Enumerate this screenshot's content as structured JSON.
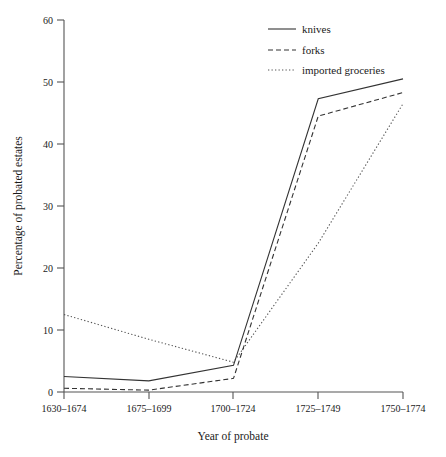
{
  "chart_data": {
    "type": "line",
    "title": "",
    "xlabel": "Year of probate",
    "ylabel": "Percentage of probated estates",
    "categories": [
      "1630–1674",
      "1675–1699",
      "1700–1724",
      "1725–1749",
      "1750–1774"
    ],
    "ylim": [
      0,
      60
    ],
    "yticks": [
      0,
      10,
      20,
      30,
      40,
      50,
      60
    ],
    "ytick_labels": [
      "0",
      "10",
      "20",
      "30",
      "40",
      "50",
      "60"
    ],
    "grid": false,
    "legend_position": "top-right",
    "series": [
      {
        "name": "knives",
        "style": "solid",
        "color": "#333333",
        "values": [
          2.5,
          1.8,
          4.3,
          47.3,
          50.5
        ]
      },
      {
        "name": "forks",
        "style": "dashed",
        "color": "#333333",
        "values": [
          0.6,
          0.3,
          2.2,
          44.5,
          48.3
        ]
      },
      {
        "name": "imported groceries",
        "style": "dotted",
        "color": "#555555",
        "values": [
          12.5,
          8.5,
          4.8,
          24.0,
          46.5
        ]
      }
    ]
  },
  "legend": {
    "items": [
      {
        "label": "knives"
      },
      {
        "label": "forks"
      },
      {
        "label": "imported groceries"
      }
    ]
  },
  "axes": {
    "y_title": "Percentage of probated estates",
    "x_title": "Year of probate",
    "ytick_0": "0",
    "ytick_1": "10",
    "ytick_2": "20",
    "ytick_3": "30",
    "ytick_4": "40",
    "ytick_5": "50",
    "ytick_6": "60",
    "xtick_0": "1630–1674",
    "xtick_1": "1675–1699",
    "xtick_2": "1700–1724",
    "xtick_3": "1725–1749",
    "xtick_4": "1750–1774"
  }
}
